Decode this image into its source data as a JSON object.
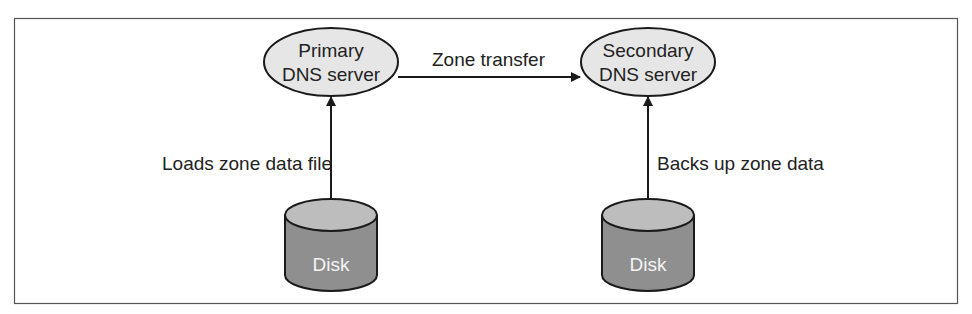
{
  "diagram": {
    "nodes": {
      "primary": {
        "line1": "Primary",
        "line2": "DNS server"
      },
      "secondary": {
        "line1": "Secondary",
        "line2": "DNS server"
      },
      "disk_left": {
        "label": "Disk"
      },
      "disk_right": {
        "label": "Disk"
      }
    },
    "edges": {
      "zone_transfer": {
        "label": "Zone transfer"
      },
      "loads": {
        "label": "Loads zone data file"
      },
      "backs_up": {
        "label": "Backs up zone data"
      }
    },
    "colors": {
      "ellipse_fill": "#e6e6e6",
      "disk_top": "#bdbdbd",
      "disk_body": "#8f8f8f",
      "stroke": "#1a1a1a",
      "frame": "#555555"
    }
  }
}
